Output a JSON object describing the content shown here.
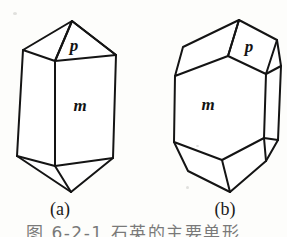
{
  "figure": {
    "ink_color": "#141414",
    "paper_color": "#fdfdfb",
    "panels": [
      {
        "id": "a",
        "caption": "(a)",
        "description": "Elongated prismatic crystal with pyramidal terminations",
        "labels": [
          {
            "name": "p",
            "text": "p",
            "meaning": "pyramid face"
          },
          {
            "name": "m",
            "text": "m",
            "meaning": "prism face"
          }
        ]
      },
      {
        "id": "b",
        "caption": "(b)",
        "description": "Stubby polyhedral crystal with multiple bevelled faces",
        "labels": [
          {
            "name": "p",
            "text": "p",
            "meaning": "pyramid face"
          },
          {
            "name": "m",
            "text": "m",
            "meaning": "prism face"
          }
        ]
      }
    ],
    "bottom_caption": "图 6-2-1  石英的主要单形"
  }
}
